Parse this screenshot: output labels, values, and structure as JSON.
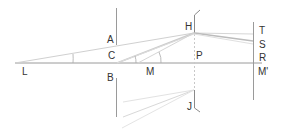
{
  "diagram": {
    "title": "",
    "labels": {
      "A": "A",
      "B": "B",
      "C": "C",
      "L": "L",
      "M": "M",
      "H": "H",
      "J": "J",
      "P": "P",
      "T": "T",
      "S": "S",
      "R": "R",
      "M_prime": "M'"
    },
    "colors": {
      "line": "#9a9a9a",
      "ray": "#cfcfcf",
      "text": "#333333"
    }
  }
}
